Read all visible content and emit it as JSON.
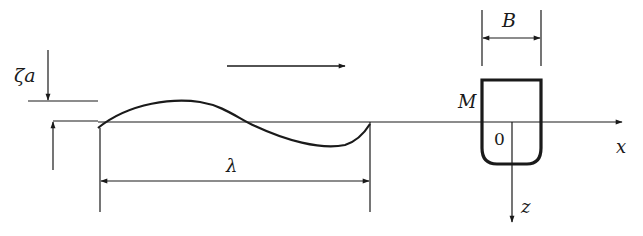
{
  "diagram": {
    "title": "",
    "labels": {
      "amplitude": "ζa",
      "wavelength": "λ",
      "beam": "B",
      "midship": "M",
      "origin": "0",
      "x_axis": "x",
      "z_axis": "z"
    },
    "elements": [
      {
        "name": "wave-direction-arrow",
        "description": "wave propagation direction, pointing right"
      },
      {
        "name": "wave-profile",
        "description": "one full sinusoidal wavelength on still waterline"
      },
      {
        "name": "ship-section",
        "description": "midship cross-section with rounded bilge"
      },
      {
        "name": "amplitude-dimension",
        "description": "wave amplitude marker ζa"
      },
      {
        "name": "wavelength-dimension",
        "description": "double-headed dimension λ"
      },
      {
        "name": "beam-dimension",
        "description": "double-headed dimension B across ship"
      },
      {
        "name": "x-axis",
        "description": "horizontal axis to right"
      },
      {
        "name": "z-axis",
        "description": "vertical axis downward"
      }
    ],
    "colors": {
      "stroke": "#1a1a1a",
      "background": "#ffffff"
    }
  }
}
